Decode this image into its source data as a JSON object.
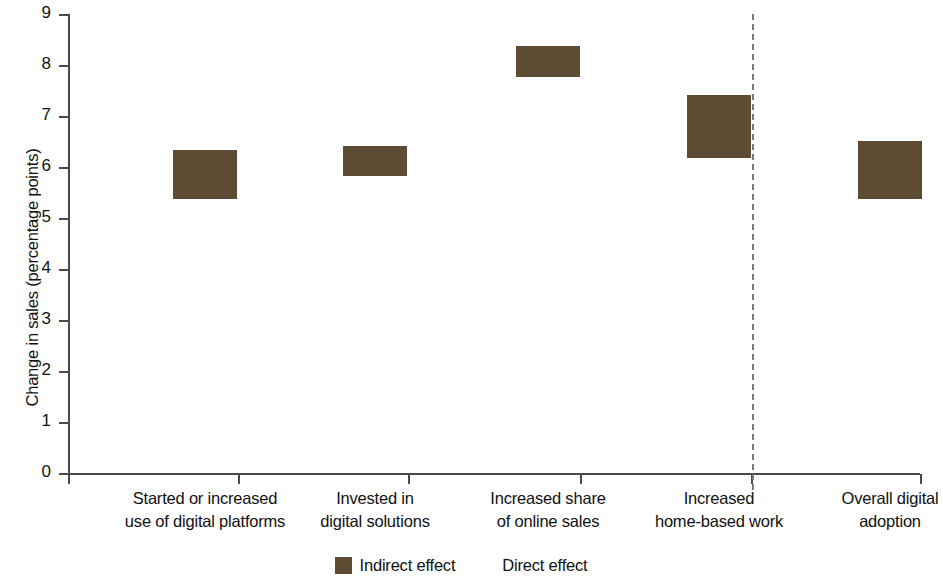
{
  "chart_data": {
    "type": "bar",
    "stacked": true,
    "title": "",
    "subtitle": "",
    "xlabel": "",
    "ylabel": "Change in sales (percentage points)",
    "ylim": [
      0,
      9
    ],
    "ytick_labels": [
      "0",
      "1",
      "2",
      "3",
      "4",
      "5",
      "6",
      "7",
      "8",
      "9"
    ],
    "ytick_values": [
      0,
      1,
      2,
      3,
      4,
      5,
      6,
      7,
      8,
      9
    ],
    "grid": false,
    "legend_position": "bottom-center",
    "categories": [
      "Started or increased use of digital platforms",
      "Invested in digital solutions",
      "Increased share of online sales",
      "Increased home-based work",
      "Overall digital adoption"
    ],
    "category_lines": [
      [
        "Started or increased",
        "use of digital platforms"
      ],
      [
        "Invested in",
        "digital solutions"
      ],
      [
        "Increased share",
        "of online sales"
      ],
      [
        "Increased",
        "home-based work"
      ],
      [
        "Overall digital",
        "adoption"
      ]
    ],
    "series": [
      {
        "name": "Direct effect",
        "color": "#F9A busy",
        "values": [
          5.35,
          5.8,
          7.75,
          6.15,
          5.35
        ]
      },
      {
        "name": "Indirect effect",
        "color": "#5D4B33",
        "values": [
          0.97,
          0.6,
          0.6,
          1.25,
          1.15
        ]
      }
    ],
    "totals": [
      6.32,
      6.4,
      8.35,
      7.4,
      6.5
    ],
    "annotations": [
      {
        "type": "vertical-dashed-line",
        "description": "separator between individual digital-adoption measures and the overall digital adoption aggregate",
        "after_category_index": 3
      }
    ]
  },
  "legend": {
    "items": [
      {
        "label": "Indirect effect",
        "color": "#5D4B33",
        "swatch_name": "legend-swatch-indirect"
      },
      {
        "label": "Direct effect",
        "color": "#F9A busy",
        "swatch_name": "legend-swatch-direct"
      }
    ]
  },
  "colors": {
    "direct": "#F9A busy",
    "indirect": "#5D4B33",
    "axis": "#4a4a4a",
    "divider": "#7a7a7a",
    "text": "#111111",
    "background": "#ffffff"
  }
}
